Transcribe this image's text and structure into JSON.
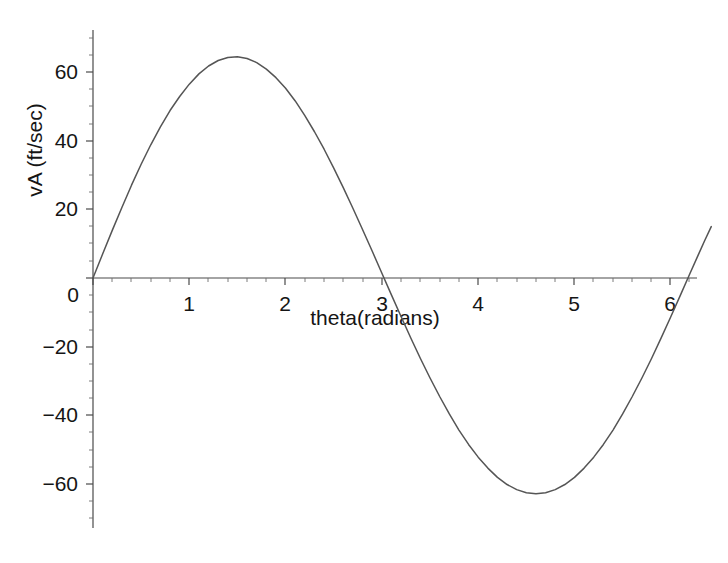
{
  "chart_data": {
    "type": "line",
    "title": "",
    "subtitle": "",
    "xlabel": "theta(radians)",
    "ylabel": "vA (ft/sec)",
    "xlim": [
      0,
      6.45
    ],
    "ylim": [
      -72,
      72
    ],
    "grid": false,
    "legend": null,
    "x_ticks": [
      0,
      1,
      2,
      3,
      4,
      5,
      6
    ],
    "x_tick_labels": [
      "0",
      "1",
      "2",
      "3",
      "4",
      "5",
      "6"
    ],
    "y_ticks": [
      -60,
      -40,
      -20,
      0,
      20,
      40,
      60
    ],
    "y_tick_labels": [
      "−60",
      "−40",
      "−20",
      "0",
      "20",
      "40",
      "60"
    ],
    "x_minor_tick_step": 0.2,
    "y_minor_tick_step": 5,
    "annotations": [],
    "series": [
      {
        "name": "vA",
        "color": "#555555",
        "x": [
          0.0,
          0.1,
          0.2,
          0.3,
          0.4,
          0.5,
          0.6,
          0.7,
          0.8,
          0.9,
          1.0,
          1.1,
          1.2,
          1.3,
          1.4,
          1.5,
          1.6,
          1.7,
          1.8,
          1.9,
          2.0,
          2.1,
          2.2,
          2.3,
          2.4,
          2.5,
          2.6,
          2.7,
          2.8,
          2.9,
          3.0,
          3.1,
          3.2,
          3.3,
          3.4,
          3.5,
          3.6,
          3.7,
          3.8,
          3.9,
          4.0,
          4.1,
          4.2,
          4.3,
          4.4,
          4.5,
          4.6,
          4.7,
          4.8,
          4.9,
          5.0,
          5.1,
          5.2,
          5.3,
          5.4,
          5.5,
          5.6,
          5.7,
          5.8,
          5.9,
          6.0,
          6.1,
          6.2,
          6.283,
          6.35,
          6.42
        ],
        "y": [
          0.0,
          7.0,
          13.9,
          20.6,
          27.1,
          33.2,
          38.9,
          44.1,
          48.9,
          53.0,
          56.6,
          59.6,
          61.9,
          63.5,
          64.4,
          64.6,
          64.1,
          62.9,
          61.0,
          58.5,
          55.4,
          51.7,
          47.4,
          42.7,
          37.6,
          32.1,
          26.3,
          20.3,
          14.1,
          7.8,
          1.4,
          -5.0,
          -11.3,
          -17.5,
          -23.5,
          -29.2,
          -34.6,
          -39.7,
          -44.4,
          -48.6,
          -52.3,
          -55.5,
          -58.2,
          -60.3,
          -61.8,
          -62.7,
          -63.0,
          -62.7,
          -61.8,
          -60.3,
          -58.2,
          -55.5,
          -52.3,
          -48.6,
          -44.4,
          -39.7,
          -34.6,
          -29.2,
          -23.5,
          -17.5,
          -11.3,
          -5.0,
          1.4,
          6.6,
          10.8,
          15.0
        ]
      }
    ],
    "peak": {
      "theta": 1.45,
      "value": 64.6
    },
    "trough": {
      "theta": 4.6,
      "value": -63.0
    },
    "zero_crossings": [
      0.0,
      3.02
    ]
  }
}
